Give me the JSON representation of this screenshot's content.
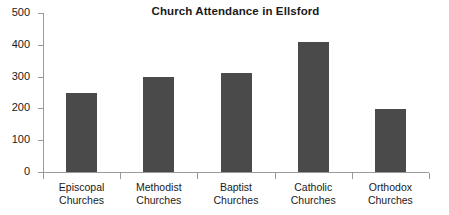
{
  "chart_data": {
    "type": "bar",
    "title": "Church Attendance in Ellsford",
    "xlabel": "",
    "ylabel": "",
    "categories": [
      "Episcopal Churches",
      "Methodist Churches",
      "Baptist Churches",
      "Catholic Churches",
      "Orthodox Churches"
    ],
    "category_lines": [
      [
        "Episcopal",
        "Churches"
      ],
      [
        "Methodist",
        "Churches"
      ],
      [
        "Baptist",
        "Churches"
      ],
      [
        "Catholic",
        "Churches"
      ],
      [
        "Orthodox",
        "Churches"
      ]
    ],
    "values": [
      250,
      300,
      312,
      408,
      198
    ],
    "ylim": [
      0,
      500
    ],
    "yticks": [
      0,
      100,
      200,
      300,
      400,
      500
    ],
    "ytick_labels": [
      "0",
      "100",
      "200",
      "300",
      "400",
      "500"
    ],
    "grid": false,
    "legend": null,
    "series": [
      {
        "name": "Attendance",
        "values": [
          250,
          300,
          312,
          408,
          198
        ],
        "color": "#4a4a4a"
      }
    ]
  },
  "colors": {
    "bar_fill": "#4a4a4a",
    "axis_line": "#9a9a9a",
    "text": "#1a1a1a",
    "background": "#ffffff"
  }
}
